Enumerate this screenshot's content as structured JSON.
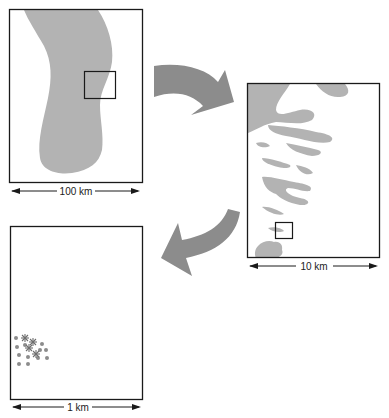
{
  "diagram": {
    "colors": {
      "frame": "#1a1a1a",
      "feature_fill": "#b3b3b3",
      "arrow_fill": "#8c8c8c",
      "background": "#ffffff",
      "text": "#222222"
    },
    "panels": [
      {
        "id": "panel-1",
        "scale_label": "100 km",
        "content": "large elongated gray region with a small inset square"
      },
      {
        "id": "panel-2",
        "scale_label": "10 km",
        "content": "banded gray patches with a small inset square"
      },
      {
        "id": "panel-3",
        "scale_label": "1 km",
        "content": "small cluster of dots and asterisk marks"
      }
    ],
    "arrows": [
      {
        "id": "arrow-1",
        "from": "panel-1",
        "to": "panel-2",
        "direction": "curved-right-down"
      },
      {
        "id": "arrow-2",
        "from": "panel-2",
        "to": "panel-3",
        "direction": "curved-left-down"
      }
    ]
  }
}
